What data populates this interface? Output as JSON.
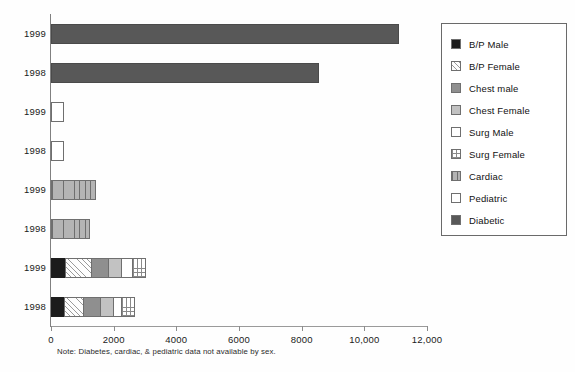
{
  "chart_data": {
    "type": "bar",
    "orientation": "horizontal",
    "stacked": true,
    "title": "",
    "xlabel": "",
    "ylabel": "",
    "xlim": [
      0,
      12000
    ],
    "grid": false,
    "legend_position": "right",
    "xticks": [
      0,
      2000,
      4000,
      6000,
      8000,
      10000,
      12000
    ],
    "xtick_labels": [
      "0",
      "2000",
      "4000",
      "6000",
      "8000",
      "10,000",
      "12,000"
    ],
    "categories": [
      "1999",
      "1998",
      "1999",
      "1998",
      "1999",
      "1998",
      "1999",
      "1998"
    ],
    "series": [
      {
        "name": "B/P Male",
        "values": [
          0,
          0,
          0,
          0,
          0,
          0,
          460,
          430
        ]
      },
      {
        "name": "B/P Female",
        "values": [
          0,
          0,
          0,
          0,
          0,
          0,
          810,
          600
        ]
      },
      {
        "name": "Chest male",
        "values": [
          0,
          0,
          0,
          0,
          0,
          0,
          560,
          520
        ]
      },
      {
        "name": "Chest Female",
        "values": [
          0,
          0,
          0,
          0,
          0,
          0,
          420,
          430
        ]
      },
      {
        "name": "Surg Male",
        "values": [
          0,
          0,
          0,
          0,
          0,
          0,
          350,
          240
        ]
      },
      {
        "name": "Surg Female",
        "values": [
          0,
          0,
          0,
          0,
          0,
          0,
          430,
          460
        ]
      },
      {
        "name": "Cardiac",
        "values": [
          0,
          0,
          0,
          0,
          1440,
          1250,
          0,
          0
        ]
      },
      {
        "name": "Pediatric",
        "values": [
          0,
          0,
          420,
          400,
          0,
          0,
          0,
          0
        ]
      },
      {
        "name": "Diabetic",
        "values": [
          11100,
          8560,
          0,
          0,
          0,
          0,
          0,
          0
        ]
      }
    ],
    "note": "Note: Diabetes, cardiac, & pediatric data not available by sex.",
    "rows": [
      {
        "label": "1999",
        "segments": [
          {
            "series": "Diabetic",
            "value": 11100,
            "fill": "f-diabetic"
          }
        ]
      },
      {
        "label": "1998",
        "segments": [
          {
            "series": "Diabetic",
            "value": 8560,
            "fill": "f-diabetic"
          }
        ]
      },
      {
        "label": "1999",
        "segments": [
          {
            "series": "Pediatric",
            "value": 420,
            "fill": "f-white"
          }
        ]
      },
      {
        "label": "1998",
        "segments": [
          {
            "series": "Pediatric",
            "value": 400,
            "fill": "f-white"
          }
        ]
      },
      {
        "label": "1999",
        "segments": [
          {
            "series": "Cardiac",
            "value": 1440,
            "fill": "f-vstripe"
          }
        ]
      },
      {
        "label": "1998",
        "segments": [
          {
            "series": "Cardiac",
            "value": 1250,
            "fill": "f-vstripe"
          }
        ]
      },
      {
        "label": "1999",
        "segments": [
          {
            "series": "B/P Male",
            "value": 460,
            "fill": "f-black"
          },
          {
            "series": "B/P Female",
            "value": 810,
            "fill": "f-hatch"
          },
          {
            "series": "Chest male",
            "value": 560,
            "fill": "f-dkgray"
          },
          {
            "series": "Chest Female",
            "value": 420,
            "fill": "f-ltgray"
          },
          {
            "series": "Surg Male",
            "value": 350,
            "fill": "f-white"
          },
          {
            "series": "Surg Female",
            "value": 430,
            "fill": "f-grid"
          }
        ]
      },
      {
        "label": "1998",
        "segments": [
          {
            "series": "B/P Male",
            "value": 430,
            "fill": "f-black"
          },
          {
            "series": "B/P Female",
            "value": 600,
            "fill": "f-hatch"
          },
          {
            "series": "Chest male",
            "value": 520,
            "fill": "f-dkgray"
          },
          {
            "series": "Chest Female",
            "value": 430,
            "fill": "f-ltgray"
          },
          {
            "series": "Surg Male",
            "value": 240,
            "fill": "f-white"
          },
          {
            "series": "Surg Female",
            "value": 460,
            "fill": "f-grid"
          }
        ]
      }
    ]
  },
  "legend": {
    "items": [
      {
        "label": "B/P Male",
        "fill": "f-black",
        "icon": "legend-swatch-solid-black"
      },
      {
        "label": "B/P Female",
        "fill": "f-hatch",
        "icon": "legend-swatch-diagonal-hatch"
      },
      {
        "label": "Chest male",
        "fill": "f-dkgray",
        "icon": "legend-swatch-dark-gray"
      },
      {
        "label": "Chest Female",
        "fill": "f-ltgray",
        "icon": "legend-swatch-light-gray"
      },
      {
        "label": "Surg Male",
        "fill": "f-white",
        "icon": "legend-swatch-white"
      },
      {
        "label": "Surg Female",
        "fill": "f-grid",
        "icon": "legend-swatch-grid"
      },
      {
        "label": "Cardiac",
        "fill": "f-vstripe",
        "icon": "legend-swatch-vertical-stripe"
      },
      {
        "label": "Pediatric",
        "fill": "f-white",
        "icon": "legend-swatch-white"
      },
      {
        "label": "Diabetic",
        "fill": "f-diabetic",
        "icon": "legend-swatch-medium-gray"
      }
    ]
  },
  "note": {
    "text": "Note: Diabetes, cardiac, & pediatric data not available by sex."
  }
}
